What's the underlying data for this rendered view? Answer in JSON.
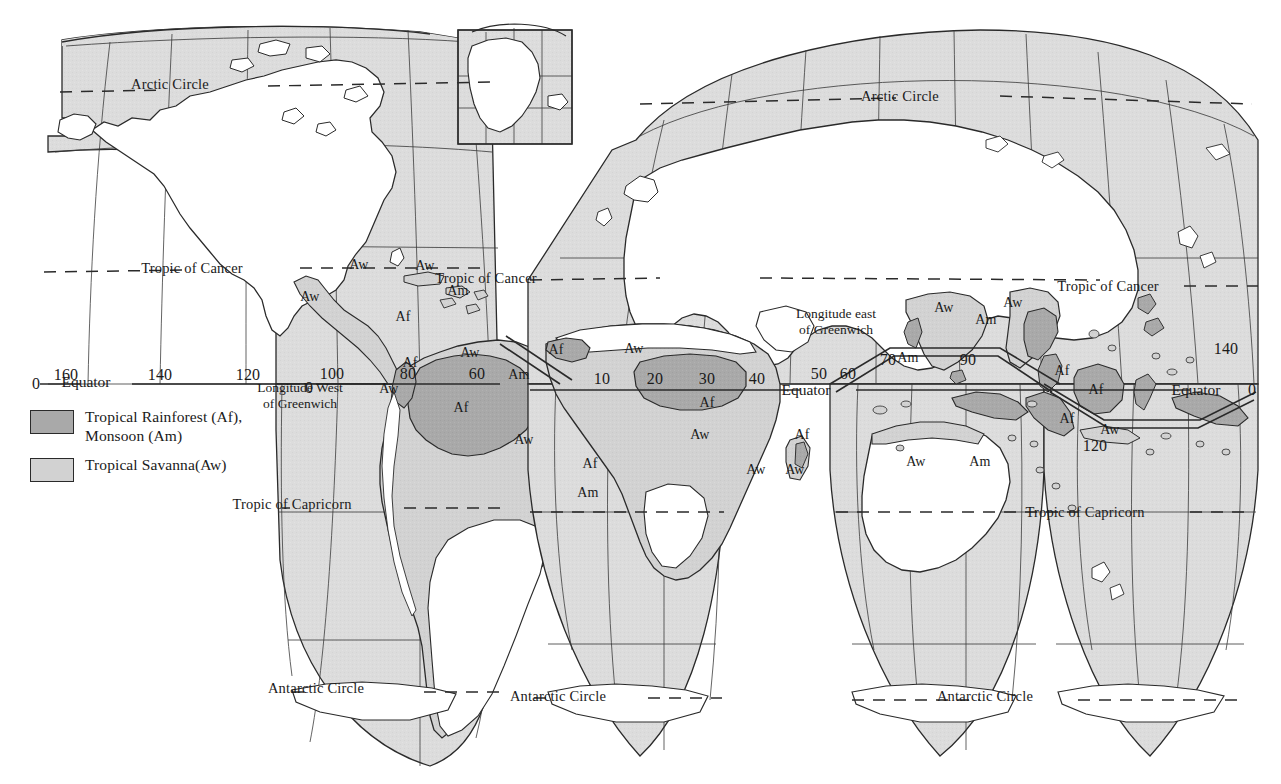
{
  "map": {
    "title": "World map of tropical climates (interrupted projection)",
    "projection": "interrupted-homolosine",
    "colors": {
      "ocean": "#dcdcdc",
      "land": "#ffffff",
      "savanna": "#d2d2d2",
      "rainforest": "#a9a9a9",
      "outline": "#2a2a2a",
      "graticule": "#3a3a3a",
      "text": "#1a1a1a",
      "page": "#ffffff"
    }
  },
  "legend": {
    "items": [
      {
        "label": "Tropical Rainforest (Af),\nMonsoon (Am)",
        "swatch": "rainforest"
      },
      {
        "label": "Tropical Savanna(Aw)",
        "swatch": "savanna"
      }
    ]
  },
  "latitude_lines": [
    {
      "id": "arctic-left",
      "label": "Arctic Circle",
      "x": 170,
      "y": 84
    },
    {
      "id": "arctic-right",
      "label": "Arctic Circle",
      "x": 900,
      "y": 96
    },
    {
      "id": "cancer-left",
      "label": "Tropic of Cancer",
      "x": 192,
      "y": 268
    },
    {
      "id": "cancer-mid",
      "label": "Tropic of Cancer",
      "x": 486,
      "y": 278
    },
    {
      "id": "cancer-right",
      "label": "Tropic of Cancer",
      "x": 1108,
      "y": 286
    },
    {
      "id": "capricorn-left",
      "label": "Tropic of Capricorn",
      "x": 292,
      "y": 504
    },
    {
      "id": "capricorn-right",
      "label": "Tropic of Capricorn",
      "x": 1085,
      "y": 512
    },
    {
      "id": "antarctic-left",
      "label": "Antarctic Circle",
      "x": 316,
      "y": 688
    },
    {
      "id": "antarctic-mid",
      "label": "Antarctic Circle",
      "x": 558,
      "y": 696
    },
    {
      "id": "antarctic-right",
      "label": "Antarctic Circle",
      "x": 985,
      "y": 696
    }
  ],
  "equator_labels": [
    {
      "id": "equator-west",
      "label": "Equator",
      "x": 86,
      "y": 382
    },
    {
      "id": "equator-east",
      "label": "Equator",
      "x": 806,
      "y": 390
    },
    {
      "id": "equator-far",
      "label": "Equator",
      "x": 1196,
      "y": 390
    }
  ],
  "longitude_labels": [
    {
      "value": "0",
      "x": 36,
      "y": 384
    },
    {
      "value": "160",
      "x": 66,
      "y": 375
    },
    {
      "value": "140",
      "x": 160,
      "y": 375
    },
    {
      "value": "120",
      "x": 248,
      "y": 375
    },
    {
      "value": "0",
      "x": 309,
      "y": 388
    },
    {
      "value": "100",
      "x": 332,
      "y": 374
    },
    {
      "value": "80",
      "x": 408,
      "y": 374
    },
    {
      "value": "60",
      "x": 477,
      "y": 374
    },
    {
      "value": "10",
      "x": 602,
      "y": 379
    },
    {
      "value": "20",
      "x": 655,
      "y": 379
    },
    {
      "value": "30",
      "x": 707,
      "y": 379
    },
    {
      "value": "40",
      "x": 757,
      "y": 379
    },
    {
      "value": "50",
      "x": 819,
      "y": 374
    },
    {
      "value": "60",
      "x": 848,
      "y": 374
    },
    {
      "value": "70",
      "x": 888,
      "y": 360
    },
    {
      "value": "90",
      "x": 968,
      "y": 360
    },
    {
      "value": "120",
      "x": 1095,
      "y": 446
    },
    {
      "value": "140",
      "x": 1226,
      "y": 349
    },
    {
      "value": "0",
      "x": 1252,
      "y": 390
    }
  ],
  "annotations": [
    {
      "id": "lon-west-note",
      "label": "Longitude West\nof Greenwich",
      "x": 300,
      "y": 396
    },
    {
      "id": "lon-east-note",
      "label": "Longitude east\nof Greenwich",
      "x": 836,
      "y": 322
    }
  ],
  "zone_labels": [
    {
      "code": "Aw",
      "region": "nw-mexico",
      "x": 310,
      "y": 297
    },
    {
      "code": "Aw",
      "region": "mexico-gulf",
      "x": 359,
      "y": 265
    },
    {
      "code": "Aw",
      "region": "cuba",
      "x": 425,
      "y": 266
    },
    {
      "code": "Am",
      "region": "hispaniola",
      "x": 458,
      "y": 291
    },
    {
      "code": "Af",
      "region": "central-america",
      "x": 403,
      "y": 317
    },
    {
      "code": "Af",
      "region": "panama",
      "x": 410,
      "y": 363
    },
    {
      "code": "Aw",
      "region": "colombia-coast",
      "x": 389,
      "y": 389
    },
    {
      "code": "Aw",
      "region": "venezuela",
      "x": 470,
      "y": 353
    },
    {
      "code": "Am",
      "region": "guiana",
      "x": 519,
      "y": 375
    },
    {
      "code": "Af",
      "region": "amazon",
      "x": 461,
      "y": 408
    },
    {
      "code": "Aw",
      "region": "brazil-central",
      "x": 524,
      "y": 440
    },
    {
      "code": "Af",
      "region": "brazil-coast",
      "x": 590,
      "y": 464
    },
    {
      "code": "Am",
      "region": "brazil-ne",
      "x": 588,
      "y": 493
    },
    {
      "code": "Af",
      "region": "west-africa",
      "x": 556,
      "y": 350
    },
    {
      "code": "Aw",
      "region": "sahel",
      "x": 634,
      "y": 349
    },
    {
      "code": "Af",
      "region": "congo",
      "x": 707,
      "y": 403
    },
    {
      "code": "Aw",
      "region": "southern-africa",
      "x": 700,
      "y": 435
    },
    {
      "code": "Af",
      "region": "east-africa",
      "x": 802,
      "y": 435
    },
    {
      "code": "Aw",
      "region": "mozambique",
      "x": 756,
      "y": 470
    },
    {
      "code": "Aw",
      "region": "madagascar",
      "x": 795,
      "y": 470
    },
    {
      "code": "Aw",
      "region": "india",
      "x": 944,
      "y": 308
    },
    {
      "code": "Aw",
      "region": "indochina-north",
      "x": 1013,
      "y": 303
    },
    {
      "code": "Am",
      "region": "bay-of-bengal",
      "x": 986,
      "y": 320
    },
    {
      "code": "Am",
      "region": "india-west",
      "x": 908,
      "y": 358
    },
    {
      "code": "Af",
      "region": "malaysia",
      "x": 1062,
      "y": 371
    },
    {
      "code": "Af",
      "region": "borneo",
      "x": 1096,
      "y": 390
    },
    {
      "code": "Af",
      "region": "sumatra",
      "x": 1067,
      "y": 419
    },
    {
      "code": "Aw",
      "region": "java",
      "x": 1110,
      "y": 430
    },
    {
      "code": "Aw",
      "region": "australia-north",
      "x": 916,
      "y": 462
    },
    {
      "code": "Am",
      "region": "papua",
      "x": 980,
      "y": 462
    }
  ]
}
